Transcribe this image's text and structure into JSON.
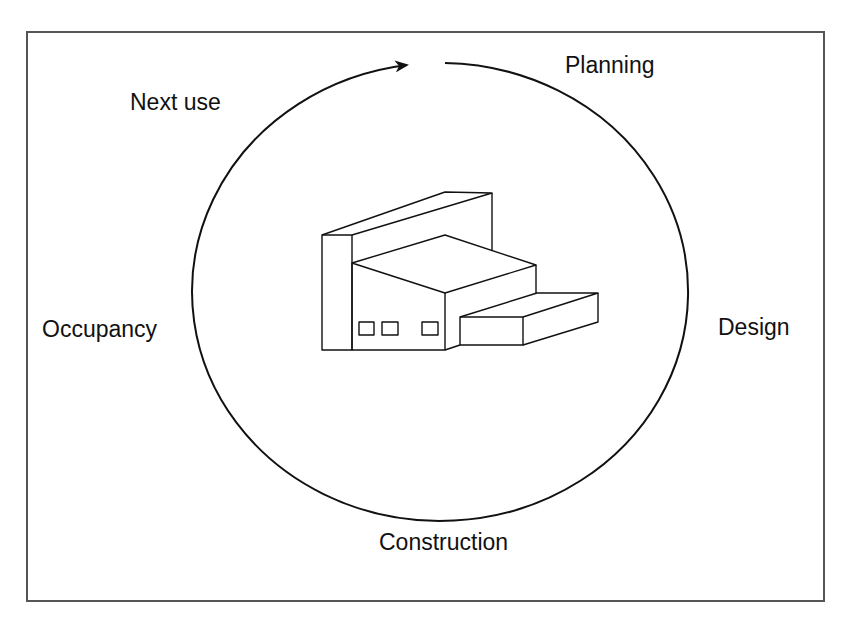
{
  "diagram": {
    "type": "cycle",
    "title": "",
    "center_icon": "building-icon",
    "stages": [
      {
        "label": "Planning",
        "position": "top-right"
      },
      {
        "label": "Design",
        "position": "right"
      },
      {
        "label": "Construction",
        "position": "bottom"
      },
      {
        "label": "Occupancy",
        "position": "left"
      },
      {
        "label": "Next use",
        "position": "top-left"
      }
    ],
    "direction": "clockwise",
    "colors": {
      "line": "#111111",
      "frame": "#555555",
      "background": "#ffffff"
    }
  }
}
